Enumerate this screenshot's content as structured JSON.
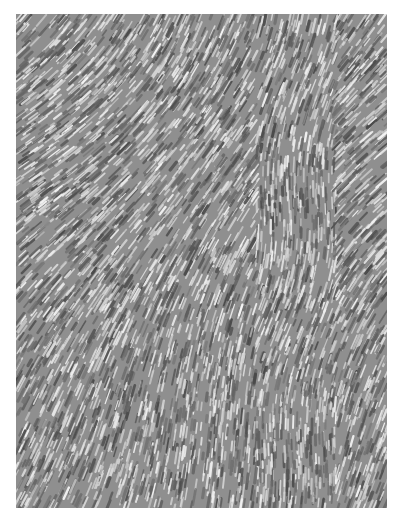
{
  "image": {
    "description": "Grayscale phase-contrast micrograph of densely packed elongated spindle-shaped cells forming swirling parallel arrays",
    "palette": {
      "background": "#ffffff",
      "mid": "#8f8f8f",
      "dark": "#555555",
      "light": "#eeeeee"
    },
    "frame": {
      "x": 16,
      "y": 14,
      "width": 371,
      "height": 494
    }
  }
}
